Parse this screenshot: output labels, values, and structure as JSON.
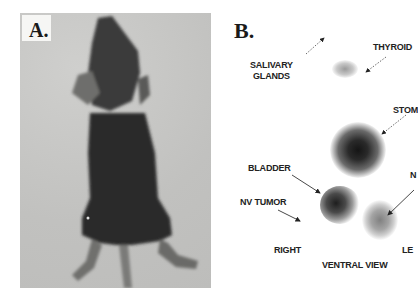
{
  "figure": {
    "panel_a": {
      "label": "A.",
      "content": "photograph of mouse, ventral view"
    },
    "panel_b": {
      "label": "B.",
      "labels": {
        "salivary_glands_line1": "SALIVARY",
        "salivary_glands_line2": "GLANDS",
        "thyroid": "THYROID",
        "stomach": "STOM",
        "bladder": "BLADDER",
        "nv_tumor": "NV TUMOR",
        "right_side_partial": "N",
        "right": "RIGHT",
        "left": "LE",
        "view": "VENTRAL VIEW"
      }
    }
  }
}
